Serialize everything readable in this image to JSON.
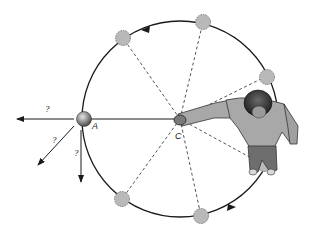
{
  "diagram": {
    "center_label": "C",
    "point_label": "A",
    "question_marks": [
      "?",
      "?",
      "?"
    ],
    "colors": {
      "line": "#1a1a1a",
      "dashed": "#555555",
      "ghost_ball": "#b9b9b9",
      "ball": "#8a8a8a",
      "person_shirt": "#a8a8a8",
      "person_hair": "#3a3a3a",
      "person_pants": "#6e6e6e"
    },
    "circle": {
      "cx": 180,
      "cy": 119,
      "r": 98
    },
    "ghost_balls_deg": [
      124,
      78,
      32,
      -28,
      -78,
      -124
    ],
    "direction_arrows": [
      "counterclockwise-top",
      "counterclockwise-bottom"
    ]
  }
}
